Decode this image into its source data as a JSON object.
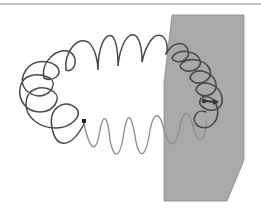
{
  "diagram": {
    "type": "toroidal-coil-through-plane",
    "colors": {
      "background": "#ffffff",
      "plane_fill": "#a9a9a9",
      "plane_edge": "#8a8a8a",
      "coil_front": "#4a4a4a",
      "coil_back": "#8c8c8c",
      "top_rule": "#888888"
    },
    "elements": [
      "top-rule",
      "plane",
      "toroidal-coil",
      "wire-end-terminal",
      "arrow-marker"
    ]
  }
}
